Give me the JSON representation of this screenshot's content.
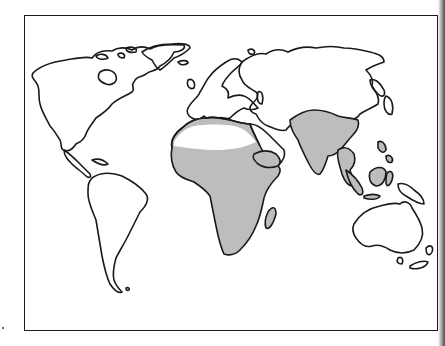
{
  "map": {
    "type": "world-outline-map",
    "projection": "pacific-inclusive equirectangular-like",
    "highlight_color": "#bdbdbd",
    "outline_color": "#1a1a1a",
    "background_color": "#ffffff",
    "shaded_regions": [
      "north-africa-coast",
      "sub-saharan-africa",
      "arabian-peninsula-south",
      "south-asia",
      "southeast-asia",
      "indonesia-borneo-sulawesi"
    ],
    "unshaded_regions": [
      "north-america",
      "south-america",
      "europe",
      "northern-asia",
      "sahara-desert",
      "australia",
      "new-zealand"
    ]
  }
}
